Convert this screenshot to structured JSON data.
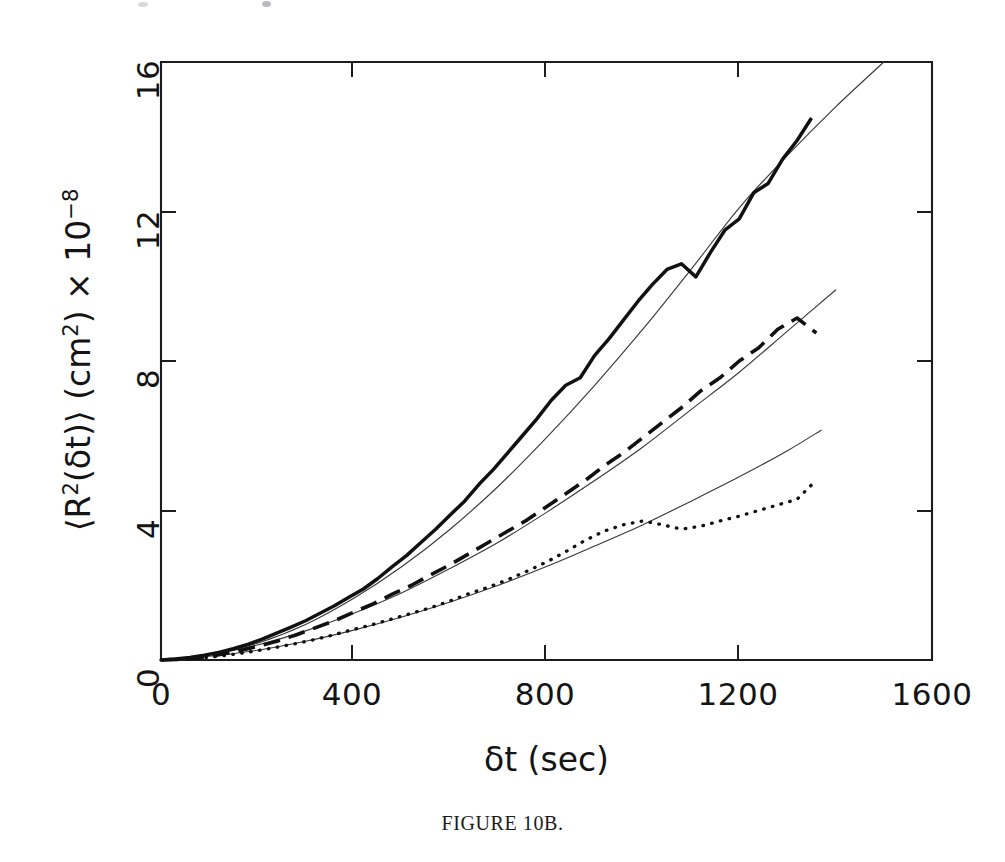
{
  "figure": {
    "caption": "FIGURE 10B.",
    "background_color": "#ffffff",
    "ink_color": "#111111"
  },
  "axes": {
    "x_title": "δt  (sec)",
    "y_title_prefix": "⟨R",
    "y_title_sup1": "2",
    "y_title_mid": "(δt)⟩  (cm",
    "y_title_sup2": "2",
    "y_title_after": ")  × 10",
    "y_title_sup3": "−8",
    "x_ticks": [
      "0",
      "400",
      "800",
      "1200",
      "1600"
    ],
    "y_ticks": [
      "0",
      "4",
      "8",
      "12",
      "16"
    ]
  },
  "chart_data": {
    "type": "line",
    "title": "FIGURE 10B.",
    "xlabel": "δt  (sec)",
    "ylabel": "⟨R²(δt)⟩ (cm²) × 10⁻⁸",
    "xlim": [
      0,
      1600
    ],
    "ylim": [
      0,
      16
    ],
    "xticks": [
      0,
      400,
      800,
      1200,
      1600
    ],
    "yticks": [
      0,
      4,
      8,
      12,
      16
    ],
    "grid": false,
    "legend": "none",
    "note": "Mean-squared displacement vs lag time; three noisy measured traces (solid, dashed, dotted) each overlaid with a smooth thin super-diffusive fit curve.",
    "series": [
      {
        "name": "measured-solid",
        "style": "solid-bold",
        "x": [
          0,
          30,
          60,
          90,
          120,
          150,
          180,
          210,
          240,
          270,
          300,
          330,
          360,
          390,
          420,
          450,
          480,
          510,
          540,
          570,
          600,
          630,
          660,
          690,
          720,
          750,
          780,
          810,
          840,
          870,
          900,
          930,
          960,
          990,
          1020,
          1050,
          1080,
          1110,
          1140,
          1170,
          1200,
          1230,
          1260,
          1290,
          1320,
          1350
        ],
        "y": [
          0.0,
          0.03,
          0.07,
          0.13,
          0.2,
          0.3,
          0.42,
          0.56,
          0.72,
          0.88,
          1.05,
          1.25,
          1.45,
          1.68,
          1.9,
          2.18,
          2.5,
          2.8,
          3.15,
          3.5,
          3.88,
          4.25,
          4.7,
          5.1,
          5.55,
          6.0,
          6.45,
          6.95,
          7.35,
          7.55,
          8.15,
          8.6,
          9.1,
          9.6,
          10.05,
          10.45,
          10.6,
          10.25,
          10.9,
          11.5,
          11.8,
          12.5,
          12.75,
          13.4,
          13.9,
          14.5
        ]
      },
      {
        "name": "fit-solid",
        "style": "thin-smooth",
        "x": [
          0,
          100,
          200,
          300,
          400,
          500,
          600,
          700,
          800,
          900,
          1000,
          1100,
          1200,
          1300,
          1400,
          1500
        ],
        "y": [
          0.0,
          0.15,
          0.45,
          0.95,
          1.65,
          2.5,
          3.5,
          4.65,
          5.95,
          7.35,
          8.85,
          10.45,
          12.1,
          13.5,
          14.8,
          16.0
        ]
      },
      {
        "name": "measured-dashed",
        "style": "dashed-bold",
        "x": [
          0,
          40,
          80,
          120,
          160,
          200,
          240,
          280,
          320,
          360,
          400,
          440,
          480,
          520,
          560,
          600,
          640,
          680,
          720,
          760,
          800,
          840,
          880,
          920,
          960,
          1000,
          1040,
          1080,
          1120,
          1160,
          1200,
          1240,
          1280,
          1320,
          1360
        ],
        "y": [
          0.0,
          0.02,
          0.06,
          0.14,
          0.24,
          0.36,
          0.5,
          0.67,
          0.86,
          1.05,
          1.28,
          1.5,
          1.76,
          2.0,
          2.28,
          2.55,
          2.85,
          3.15,
          3.45,
          3.75,
          4.1,
          4.45,
          4.8,
          5.2,
          5.55,
          5.95,
          6.35,
          6.75,
          7.2,
          7.55,
          8.0,
          8.35,
          8.85,
          9.15,
          8.75
        ]
      },
      {
        "name": "fit-dashed",
        "style": "thin-smooth",
        "x": [
          0,
          100,
          200,
          300,
          400,
          500,
          600,
          700,
          800,
          900,
          1000,
          1100,
          1200,
          1300,
          1400
        ],
        "y": [
          0.0,
          0.14,
          0.4,
          0.78,
          1.25,
          1.8,
          2.45,
          3.15,
          3.95,
          4.8,
          5.7,
          6.7,
          7.7,
          8.8,
          9.9
        ]
      },
      {
        "name": "measured-dotted",
        "style": "dotted-bold",
        "x": [
          0,
          40,
          80,
          120,
          160,
          200,
          240,
          280,
          320,
          360,
          400,
          440,
          480,
          520,
          560,
          600,
          640,
          680,
          720,
          760,
          800,
          840,
          880,
          920,
          960,
          1000,
          1040,
          1080,
          1120,
          1160,
          1200,
          1240,
          1280,
          1320,
          1355,
          1360
        ],
        "y": [
          0.0,
          0.02,
          0.05,
          0.1,
          0.17,
          0.25,
          0.34,
          0.44,
          0.55,
          0.68,
          0.82,
          0.95,
          1.1,
          1.25,
          1.4,
          1.58,
          1.78,
          1.95,
          2.15,
          2.38,
          2.62,
          2.9,
          3.2,
          3.45,
          3.62,
          3.72,
          3.62,
          3.5,
          3.58,
          3.72,
          3.85,
          4.0,
          4.15,
          4.3,
          4.75,
          4.8
        ]
      },
      {
        "name": "fit-dotted",
        "style": "thin-smooth",
        "x": [
          0,
          100,
          200,
          300,
          400,
          500,
          600,
          700,
          800,
          900,
          1000,
          1100,
          1200,
          1300,
          1370
        ],
        "y": [
          0.0,
          0.1,
          0.26,
          0.5,
          0.8,
          1.15,
          1.55,
          2.0,
          2.5,
          3.05,
          3.62,
          4.25,
          4.9,
          5.6,
          6.15
        ]
      }
    ]
  },
  "plot_geometry": {
    "left_px": 161,
    "right_px": 932,
    "top_px": 62,
    "bottom_px": 660
  }
}
